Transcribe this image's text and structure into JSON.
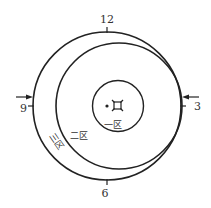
{
  "diagram": {
    "clock_labels": {
      "twelve": "12",
      "three": "3",
      "six": "6",
      "nine": "9"
    },
    "zones": {
      "zone1": "一区",
      "zone2": "二区",
      "zone3": "三区"
    },
    "center_symbol": "¤",
    "colors": {
      "line": "#222222",
      "text": "#333333",
      "background": "#ffffff"
    }
  }
}
